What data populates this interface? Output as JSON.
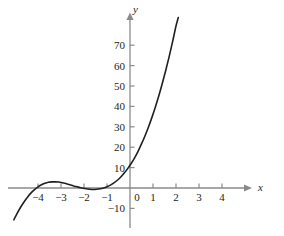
{
  "chart_data": {
    "type": "line",
    "title": "",
    "subtitle": "",
    "xlabel": "x",
    "ylabel": "y",
    "grid": false,
    "legend": null,
    "xlim": [
      -5.1,
      5.0
    ],
    "ylim": [
      -16,
      82
    ],
    "xticks": [
      -4,
      -3,
      -2,
      -1,
      0,
      1,
      2,
      3,
      4
    ],
    "xticklabels": [
      "−4",
      "−3",
      "−2",
      "−1",
      "0",
      "1",
      "2",
      "3",
      "4"
    ],
    "yticks": [
      -10,
      10,
      20,
      30,
      40,
      50,
      60,
      70
    ],
    "yticklabels": [
      "−10",
      "10",
      "20",
      "30",
      "40",
      "50",
      "60",
      "70"
    ],
    "axis_color": "#808080",
    "curve_color": "#231f20",
    "curve_width": 1.6,
    "series": [
      {
        "name": "cubic-curve",
        "x": [
          -5.05,
          -4.9,
          -4.75,
          -4.6,
          -4.45,
          -4.3,
          -4.15,
          -4.0,
          -3.85,
          -3.7,
          -3.55,
          -3.4,
          -3.25,
          -3.1,
          -2.95,
          -2.8,
          -2.65,
          -2.5,
          -2.35,
          -2.2,
          -2.05,
          -1.9,
          -1.75,
          -1.6,
          -1.45,
          -1.3,
          -1.15,
          -1.0,
          -0.85,
          -0.7,
          -0.55,
          -0.4,
          -0.25,
          -0.1,
          0.05,
          0.2,
          0.35,
          0.5,
          0.65,
          0.8,
          0.95,
          1.1,
          1.25,
          1.4,
          1.55,
          1.7,
          1.85,
          2.0,
          2.1
        ],
        "y": [
          -15.6,
          -12.3,
          -9.3,
          -6.7,
          -4.4,
          -2.4,
          -0.8,
          0.6,
          1.6,
          2.3,
          2.8,
          3.0,
          3.0,
          2.9,
          2.6,
          2.2,
          1.7,
          1.2,
          0.7,
          0.3,
          -0.1,
          -0.4,
          -0.6,
          -0.7,
          -0.6,
          -0.4,
          0.0,
          0.6,
          1.4,
          2.5,
          3.8,
          5.4,
          7.3,
          9.5,
          12.0,
          14.8,
          18.0,
          21.6,
          25.5,
          29.8,
          34.5,
          39.6,
          45.1,
          51.1,
          57.5,
          64.3,
          71.6,
          79.4,
          83.6
        ]
      }
    ],
    "annotations": []
  },
  "figure": {
    "x_axis_label": "x",
    "y_axis_label": "y",
    "x_axis_arrow": "arrow-right",
    "y_axis_arrow": "arrow-up"
  }
}
